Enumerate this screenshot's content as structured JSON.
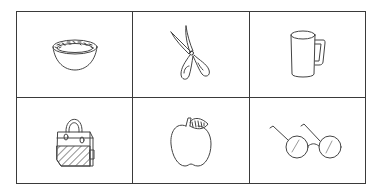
{
  "grid": {
    "rows": 2,
    "columns": 3,
    "border_color": "#3a3a3a",
    "cells": [
      {
        "item": "bowl",
        "icon": "bowl-icon"
      },
      {
        "item": "scissors",
        "icon": "scissors-icon"
      },
      {
        "item": "mug",
        "icon": "mug-icon"
      },
      {
        "item": "handbag",
        "icon": "handbag-icon"
      },
      {
        "item": "apple",
        "icon": "apple-icon"
      },
      {
        "item": "glasses",
        "icon": "glasses-icon"
      }
    ]
  }
}
